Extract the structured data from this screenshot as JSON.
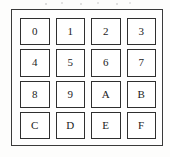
{
  "figure": {
    "name": "hexadecimal-keypad",
    "colors": {
      "page_background": "#ffffff",
      "frame_background": "#fefefe",
      "frame_border": "#3a3a3a",
      "key_background": "#ffffff",
      "key_border": "#2f2f2f",
      "key_label": "#1c1c1c"
    }
  },
  "keypad": {
    "rows": 4,
    "columns": 4,
    "keys": [
      {
        "label": "0",
        "row": 1,
        "column": 1
      },
      {
        "label": "1",
        "row": 1,
        "column": 2
      },
      {
        "label": "2",
        "row": 1,
        "column": 3
      },
      {
        "label": "3",
        "row": 1,
        "column": 4
      },
      {
        "label": "4",
        "row": 2,
        "column": 1
      },
      {
        "label": "5",
        "row": 2,
        "column": 2
      },
      {
        "label": "6",
        "row": 2,
        "column": 3
      },
      {
        "label": "7",
        "row": 2,
        "column": 4
      },
      {
        "label": "8",
        "row": 3,
        "column": 1
      },
      {
        "label": "9",
        "row": 3,
        "column": 2
      },
      {
        "label": "A",
        "row": 3,
        "column": 3
      },
      {
        "label": "B",
        "row": 3,
        "column": 4
      },
      {
        "label": "C",
        "row": 4,
        "column": 1
      },
      {
        "label": "D",
        "row": 4,
        "column": 2
      },
      {
        "label": "E",
        "row": 4,
        "column": 3
      },
      {
        "label": "F",
        "row": 4,
        "column": 4
      }
    ]
  }
}
